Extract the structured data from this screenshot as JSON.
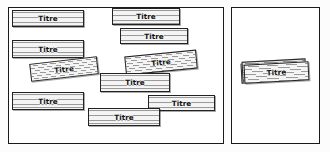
{
  "diagram": {
    "title": "",
    "colors": {
      "frame_border": "#1a1a1a",
      "card_border": "#222222",
      "card_fill": "#ebebeb",
      "card_rule_line": "#9a9a9a",
      "label_text": "#111111",
      "canvas_background": "#fcfcfc"
    },
    "panels": [
      {
        "id": "panel-left",
        "name": "left-panel",
        "cards": [
          {
            "label": "Titre",
            "x": 12,
            "y": 10,
            "w": 72,
            "h": 17,
            "rotate": 0,
            "align": "center"
          },
          {
            "label": "Titre",
            "x": 112,
            "y": 8,
            "w": 68,
            "h": 17,
            "rotate": 0,
            "align": "center"
          },
          {
            "label": "Titre",
            "x": 120,
            "y": 28,
            "w": 68,
            "h": 16,
            "rotate": 0,
            "align": "center"
          },
          {
            "label": "Titre",
            "x": 12,
            "y": 40,
            "w": 72,
            "h": 18,
            "rotate": 0,
            "align": "center"
          },
          {
            "label": "Titre",
            "x": 30,
            "y": 60,
            "w": 68,
            "h": 18,
            "rotate": -6.5,
            "align": "center"
          },
          {
            "label": "Titre",
            "x": 125,
            "y": 53,
            "w": 72,
            "h": 19,
            "rotate": -5.5,
            "align": "center"
          },
          {
            "label": "Titre",
            "x": 100,
            "y": 73,
            "w": 70,
            "h": 19,
            "rotate": 0,
            "align": "center"
          },
          {
            "label": "Titre",
            "x": 12,
            "y": 92,
            "w": 72,
            "h": 18,
            "rotate": 0,
            "align": "center"
          },
          {
            "label": "Titre",
            "x": 148,
            "y": 95,
            "w": 67,
            "h": 16,
            "rotate": 0,
            "align": "center"
          },
          {
            "label": "Titre",
            "x": 88,
            "y": 108,
            "w": 72,
            "h": 18,
            "rotate": 0,
            "align": "center"
          }
        ]
      },
      {
        "id": "panel-right",
        "name": "right-panel",
        "cards": [
          {
            "label": "Titre",
            "x": 244,
            "y": 63,
            "w": 65,
            "h": 19,
            "rotate": -3.0,
            "align": "center"
          }
        ],
        "stack_sheets": [
          {
            "x": 241,
            "y": 62,
            "w": 63,
            "h": 20,
            "rotate": -3.0
          },
          {
            "x": 242,
            "y": 60,
            "w": 64,
            "h": 20,
            "rotate": -3.0
          }
        ]
      }
    ]
  }
}
